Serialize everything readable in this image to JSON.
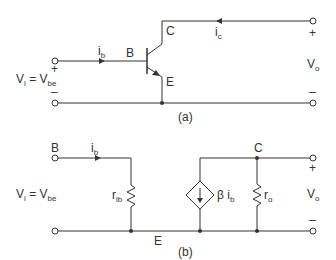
{
  "figure_a": {
    "caption": "(a)",
    "labels": {
      "input_current": "i",
      "input_current_sub": "b",
      "base": "B",
      "collector": "C",
      "emitter": "E",
      "collector_current": "i",
      "collector_current_sub": "c",
      "input_voltage_lhs": "V",
      "input_voltage_lhs_sub": "i",
      "input_voltage_eq": " = V",
      "input_voltage_rhs_sub": "be",
      "output_voltage": "V",
      "output_voltage_sub": "o",
      "plus": "+",
      "minus": "–"
    }
  },
  "figure_b": {
    "caption": "(b)",
    "labels": {
      "base": "B",
      "collector": "C",
      "emitter": "E",
      "input_current": "i",
      "input_current_sub": "b",
      "input_resistance": "r",
      "input_resistance_sub": "ib",
      "dependent_source": "β i",
      "dependent_source_sub": "b",
      "output_resistance": "r",
      "output_resistance_sub": "o",
      "input_voltage_lhs": "V",
      "input_voltage_lhs_sub": "i",
      "input_voltage_eq": " = V",
      "input_voltage_rhs_sub": "be",
      "output_voltage": "V",
      "output_voltage_sub": "o",
      "plus": "+",
      "minus": "–"
    }
  }
}
